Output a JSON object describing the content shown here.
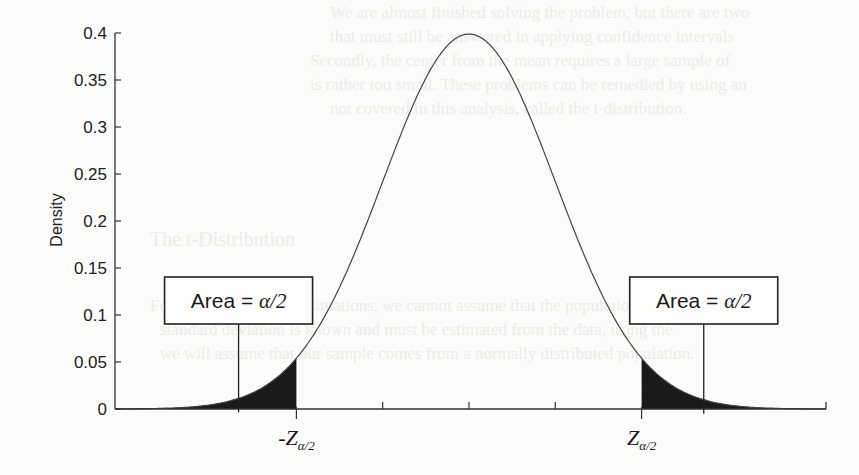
{
  "chart_data": {
    "type": "area",
    "title": "",
    "xlabel": "",
    "ylabel": "Density",
    "ylim": [
      0,
      0.4
    ],
    "xlim": [
      -4.1,
      4.15
    ],
    "grid": false,
    "yticks": [
      0,
      0.05,
      0.1,
      0.15,
      0.2,
      0.25,
      0.3,
      0.35,
      0.4
    ],
    "ytick_labels": [
      "0",
      "0.05",
      "0.1",
      "0.15",
      "0.2",
      "0.25",
      "0.3",
      "0.35",
      "0.4"
    ],
    "xticks": [
      -2,
      -1,
      0,
      1,
      2
    ],
    "xtick_labels": [
      "-Z",
      "",
      "",
      "",
      "Z"
    ],
    "xtick_label_subscript": "α/2",
    "curve": {
      "distribution": "normal",
      "mean": 0,
      "sd": 1,
      "peak_density": 0.399
    },
    "shaded_regions": [
      {
        "from": -4.1,
        "to": -2,
        "fill": "#1a1a1a"
      },
      {
        "from": 2,
        "to": 4.15,
        "fill": "#1a1a1a"
      }
    ],
    "annotations": [
      {
        "text_prefix": "Area = ",
        "text_math": "α/2",
        "points_to_x": -2.67,
        "box_center_x": -2.67,
        "box_y": 0.145
      },
      {
        "text_prefix": "Area = ",
        "text_math": "α/2",
        "points_to_x": 2.72,
        "box_center_x": 2.72,
        "box_y": 0.145
      }
    ]
  },
  "ghost_text": [
    "We are almost finished solving the problem, but there are two",
    "that must still be answered in applying confidence intervals",
    "Secondly, the center from the mean requires a large sample of",
    "is rather too small. These problems can be remedied by using an",
    "not covered in this analysis, called the t-distribution.",
    "The t-Distribution",
    "For nearly all practical situations, we cannot assume that the population",
    "standard deviation is known and must be estimated from the data, using the",
    "we will assume that our sample comes from a normally distributed population."
  ]
}
